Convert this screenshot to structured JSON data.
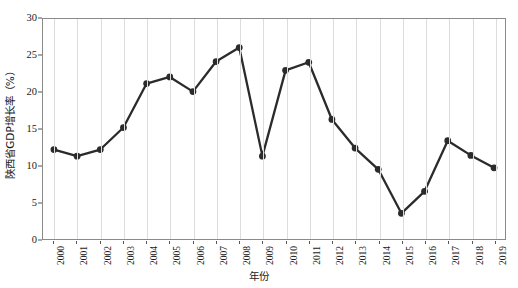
{
  "chart_data": {
    "type": "line",
    "title": "",
    "xlabel": "年份",
    "ylabel": "陕西省GDP增长率（%）",
    "categories": [
      "2000",
      "2001",
      "2002",
      "2003",
      "2004",
      "2005",
      "2006",
      "2007",
      "2008",
      "2009",
      "2010",
      "2011",
      "2012",
      "2013",
      "2014",
      "2015",
      "2016",
      "2017",
      "2018",
      "2019"
    ],
    "values": [
      12.2,
      11.3,
      12.2,
      15.2,
      21.2,
      22.1,
      20.1,
      24.2,
      26.1,
      11.3,
      23.0,
      24.1,
      16.3,
      12.4,
      9.5,
      3.5,
      6.5,
      13.4,
      11.4,
      9.7
    ],
    "series": [
      {
        "name": "陕西省GDP增长率（%）",
        "values": [
          12.2,
          11.3,
          12.2,
          15.2,
          21.2,
          22.1,
          20.1,
          24.2,
          26.1,
          11.3,
          23.0,
          24.1,
          16.3,
          12.4,
          9.5,
          3.5,
          6.5,
          13.4,
          11.4,
          9.7
        ]
      }
    ],
    "ylim": [
      0,
      30
    ],
    "yticks": [
      0,
      5,
      10,
      15,
      20,
      25,
      30
    ],
    "ytick_labels": [
      "0",
      "5",
      "10",
      "15",
      "20",
      "25",
      "30"
    ],
    "grid": "vertical-only",
    "legend": "none",
    "marker": "filled-circle",
    "line_color": "#2b2b2b",
    "marker_color": "#2b2b2b",
    "grid_color": "#dcdcdc",
    "frame_color": "#8a8a8a",
    "background_color": "#ffffff"
  }
}
